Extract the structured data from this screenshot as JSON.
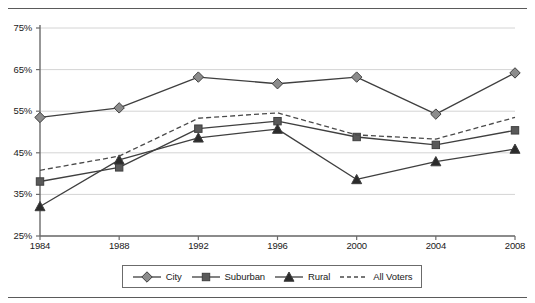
{
  "chart_data": {
    "type": "line",
    "title": "",
    "xlabel": "",
    "ylabel": "",
    "categories": [
      "1984",
      "1988",
      "1992",
      "1996",
      "2000",
      "2004",
      "2008"
    ],
    "x": [
      1984,
      1988,
      1992,
      1996,
      2000,
      2004,
      2008
    ],
    "ylim": [
      25,
      75
    ],
    "ytick_values": [
      75,
      65,
      55,
      45,
      35,
      25
    ],
    "ytick_labels": [
      "75%",
      "65%",
      "55%",
      "45%",
      "35%",
      "25%"
    ],
    "grid": "horizontal",
    "legend_position": "bottom-center",
    "series": [
      {
        "name": "City",
        "marker": "diamond",
        "line_style": "solid",
        "color": "#3f3f3f",
        "marker_fill": "#8c8c8c",
        "values": [
          53.5,
          55.8,
          63.2,
          61.6,
          63.2,
          54.3,
          64.2
        ]
      },
      {
        "name": "Suburban",
        "marker": "square",
        "line_style": "solid",
        "color": "#3f3f3f",
        "marker_fill": "#595959",
        "values": [
          38.1,
          41.5,
          50.8,
          52.6,
          48.8,
          46.9,
          50.4
        ]
      },
      {
        "name": "Rural",
        "marker": "triangle",
        "line_style": "solid",
        "color": "#3f3f3f",
        "marker_fill": "#2b2b2b",
        "values": [
          32.1,
          43.3,
          48.6,
          50.7,
          38.6,
          42.9,
          45.9
        ]
      },
      {
        "name": "All Voters",
        "marker": "none",
        "line_style": "dashed",
        "color": "#4a4a4a",
        "marker_fill": "none",
        "values": [
          40.8,
          44.2,
          53.3,
          54.6,
          49.3,
          48.3,
          53.5
        ]
      }
    ]
  },
  "legend": {
    "items": [
      {
        "label": "City",
        "icon": "diamond-marker-icon"
      },
      {
        "label": "Suburban",
        "icon": "square-marker-icon"
      },
      {
        "label": "Rural",
        "icon": "triangle-marker-icon"
      },
      {
        "label": "All Voters",
        "icon": "dashed-line-icon"
      }
    ]
  },
  "axis": {
    "y_labels": [
      "75%",
      "65%",
      "55%",
      "45%",
      "35%",
      "25%"
    ],
    "x_labels": [
      "1984",
      "1988",
      "1992",
      "1996",
      "2000",
      "2004",
      "2008"
    ]
  },
  "colors": {
    "axis": "#6b6b6b",
    "grid": "#d4d4d4",
    "line": "#3f3f3f",
    "text": "#1a1a1a",
    "rule": "#5a5a5a"
  }
}
